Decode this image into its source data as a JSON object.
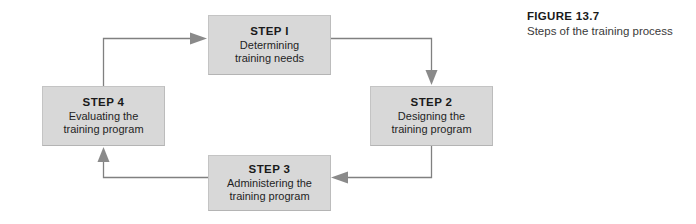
{
  "figure": {
    "title": "FIGURE 13.7",
    "subtitle": "Steps of the training process"
  },
  "diagram": {
    "type": "cycle-flowchart",
    "box_fill_color": "#d8d8d8",
    "connector_color": "#808080",
    "steps": [
      {
        "id": "step-1",
        "title": "STEP I",
        "line1": "Determining",
        "line2": "training needs"
      },
      {
        "id": "step-2",
        "title": "STEP 2",
        "line1": "Designing the",
        "line2": "training program"
      },
      {
        "id": "step-3",
        "title": "STEP 3",
        "line1": "Administering the",
        "line2": "training program"
      },
      {
        "id": "step-4",
        "title": "STEP 4",
        "line1": "Evaluating the",
        "line2": "training program"
      }
    ],
    "connectors": [
      {
        "from": "step-4",
        "to": "step-1",
        "direction": "right"
      },
      {
        "from": "step-1",
        "to": "step-2",
        "direction": "down"
      },
      {
        "from": "step-2",
        "to": "step-3",
        "direction": "left"
      },
      {
        "from": "step-3",
        "to": "step-4",
        "direction": "up"
      }
    ]
  }
}
